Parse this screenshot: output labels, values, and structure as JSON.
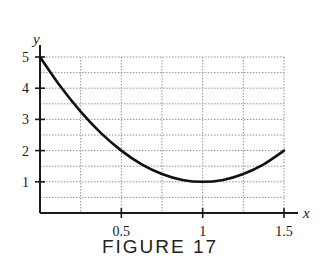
{
  "figure": {
    "caption": "FIGURE 17"
  },
  "chart_data": {
    "type": "line",
    "title": "",
    "xlabel": "x",
    "ylabel": "y",
    "xlim": [
      0,
      1.5
    ],
    "ylim": [
      0,
      5
    ],
    "x_ticks": [
      0.5,
      1,
      1.5
    ],
    "x_tick_labels": [
      "0.5",
      "1",
      "1.5"
    ],
    "y_ticks": [
      1,
      2,
      3,
      4,
      5
    ],
    "y_tick_labels": [
      "1",
      "2",
      "3",
      "4",
      "5"
    ],
    "grid": true,
    "grid_style": "dotted",
    "x_grid_step": 0.25,
    "y_grid_step": 0.5,
    "series": [
      {
        "name": "curve",
        "x": [
          0,
          0.125,
          0.25,
          0.375,
          0.5,
          0.625,
          0.75,
          0.875,
          1.0,
          1.125,
          1.25,
          1.375,
          1.5
        ],
        "values": [
          5,
          4.06,
          3.25,
          2.56,
          2.0,
          1.56,
          1.25,
          1.06,
          1.0,
          1.06,
          1.25,
          1.56,
          2.0
        ]
      }
    ],
    "legend": null
  }
}
